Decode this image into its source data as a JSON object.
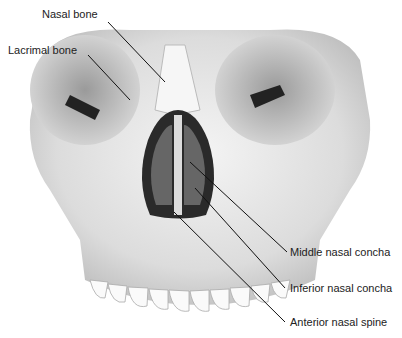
{
  "diagram": {
    "labels": [
      {
        "id": "nasal-bone",
        "text": "Nasal bone"
      },
      {
        "id": "lacrimal-bone",
        "text": "Lacrimal bone"
      },
      {
        "id": "middle-nasal-concha",
        "text": "Middle nasal concha"
      },
      {
        "id": "inferior-nasal-concha",
        "text": "Inferior nasal concha"
      },
      {
        "id": "anterior-nasal-spine",
        "text": "Anterior nasal spine"
      }
    ]
  }
}
